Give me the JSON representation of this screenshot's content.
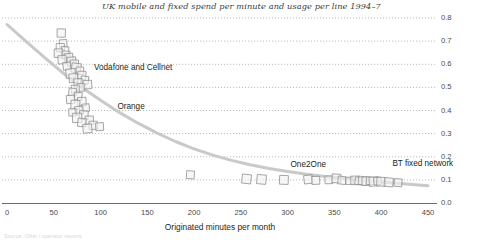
{
  "chart_data": {
    "type": "scatter",
    "title": "UK mobile and fixed spend per minute and usage per line 1994–7",
    "subtitle": "",
    "xlabel": "Originated minutes per month",
    "ylabel": "",
    "xlim": [
      0,
      450
    ],
    "ylim": [
      0.0,
      0.8
    ],
    "xticks": [
      0,
      50,
      100,
      150,
      200,
      250,
      300,
      350,
      400,
      450
    ],
    "xtick_labels": [
      "0",
      "50",
      "100",
      "150",
      "200",
      "250",
      "300",
      "350",
      "400",
      "450"
    ],
    "yticks": [
      0.0,
      0.1,
      0.2,
      0.3,
      0.4,
      0.5,
      0.6,
      0.7,
      0.8
    ],
    "ytick_labels": [
      "0.0",
      "0.1",
      "0.2",
      "0.3",
      "0.4",
      "0.5",
      "0.6",
      "0.7",
      "0.8"
    ],
    "y_axis_position": "right",
    "grid": true,
    "grid_style": "dotted",
    "legend": "none",
    "marker": "open-square",
    "colors": {
      "marker_fill": "#f2f2f2",
      "marker_edge": "#8c8c8c",
      "trend_line": "#c9c9c9",
      "grid": "#a8a8a8",
      "axis": "#6b6b6b",
      "text": "#231f20"
    },
    "annotations": [
      {
        "text": "Vodafone and Cellnet",
        "x": 93,
        "y": 0.585
      },
      {
        "text": "Orange",
        "x": 118,
        "y": 0.415
      },
      {
        "text": "One2One",
        "x": 303,
        "y": 0.165
      },
      {
        "text": "BT fixed network",
        "x": 412,
        "y": 0.168
      }
    ],
    "trend_line": {
      "name": "fitted spend-per-minute curve",
      "points": [
        [
          0,
          0.772
        ],
        [
          20,
          0.7
        ],
        [
          40,
          0.63
        ],
        [
          60,
          0.562
        ],
        [
          80,
          0.5
        ],
        [
          100,
          0.444
        ],
        [
          120,
          0.392
        ],
        [
          140,
          0.345
        ],
        [
          160,
          0.303
        ],
        [
          180,
          0.266
        ],
        [
          200,
          0.234
        ],
        [
          220,
          0.207
        ],
        [
          240,
          0.184
        ],
        [
          260,
          0.165
        ],
        [
          280,
          0.149
        ],
        [
          300,
          0.136
        ],
        [
          320,
          0.124
        ],
        [
          340,
          0.114
        ],
        [
          360,
          0.106
        ],
        [
          380,
          0.098
        ],
        [
          400,
          0.091
        ],
        [
          420,
          0.084
        ],
        [
          440,
          0.078
        ],
        [
          450,
          0.075
        ]
      ]
    },
    "series": [
      {
        "name": "Vodafone and Cellnet",
        "marker": "open-square",
        "points": [
          [
            58,
            0.735
          ],
          [
            60,
            0.69
          ],
          [
            57,
            0.672
          ],
          [
            62,
            0.66
          ],
          [
            55,
            0.648
          ],
          [
            63,
            0.64
          ],
          [
            66,
            0.628
          ],
          [
            59,
            0.62
          ],
          [
            69,
            0.612
          ],
          [
            72,
            0.6
          ],
          [
            64,
            0.592
          ],
          [
            74,
            0.584
          ],
          [
            78,
            0.572
          ],
          [
            68,
            0.56
          ],
          [
            80,
            0.552
          ],
          [
            71,
            0.54
          ],
          [
            83,
            0.532
          ],
          [
            76,
            0.52
          ],
          [
            86,
            0.512
          ],
          [
            79,
            0.5
          ],
          [
            73,
            0.492
          ]
        ]
      },
      {
        "name": "Orange",
        "marker": "open-square",
        "points": [
          [
            70,
            0.48
          ],
          [
            76,
            0.462
          ],
          [
            68,
            0.448
          ],
          [
            80,
            0.438
          ],
          [
            73,
            0.425
          ],
          [
            84,
            0.412
          ],
          [
            77,
            0.4
          ],
          [
            70,
            0.392
          ],
          [
            82,
            0.38
          ],
          [
            75,
            0.368
          ],
          [
            88,
            0.358
          ],
          [
            80,
            0.348
          ],
          [
            92,
            0.336
          ],
          [
            99,
            0.33
          ],
          [
            86,
            0.322
          ]
        ]
      },
      {
        "name": "One2One",
        "marker": "open-square",
        "points": [
          [
            196,
            0.122
          ],
          [
            256,
            0.104
          ],
          [
            272,
            0.102
          ],
          [
            296,
            0.1
          ]
        ]
      },
      {
        "name": "BT fixed network",
        "marker": "open-square",
        "points": [
          [
            322,
            0.102
          ],
          [
            330,
            0.098
          ],
          [
            344,
            0.1
          ],
          [
            352,
            0.106
          ],
          [
            358,
            0.098
          ],
          [
            366,
            0.096
          ],
          [
            372,
            0.098
          ],
          [
            376,
            0.095
          ],
          [
            380,
            0.097
          ],
          [
            384,
            0.094
          ],
          [
            388,
            0.096
          ],
          [
            392,
            0.093
          ],
          [
            396,
            0.095
          ],
          [
            400,
            0.092
          ],
          [
            408,
            0.09
          ],
          [
            418,
            0.088
          ]
        ]
      }
    ]
  },
  "source_note": "Source: Oftel / operator reports"
}
